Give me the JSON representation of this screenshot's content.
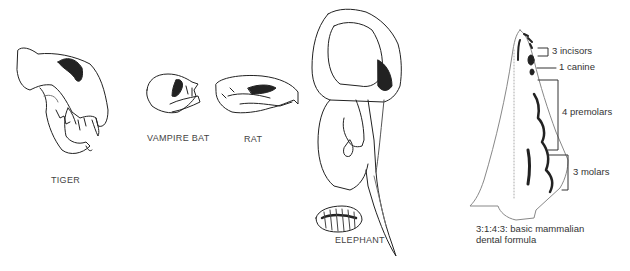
{
  "figure": {
    "specimens": [
      {
        "id": "tiger",
        "label": "TIGER"
      },
      {
        "id": "vampire-bat",
        "label": "VAMPIRE BAT"
      },
      {
        "id": "rat",
        "label": "RAT"
      },
      {
        "id": "elephant",
        "label": "ELEPHANT"
      }
    ],
    "jaw_diagram": {
      "callouts": [
        {
          "id": "incisors",
          "label": "3 incisors"
        },
        {
          "id": "canine",
          "label": "1 canine"
        },
        {
          "id": "premolars",
          "label": "4 premolars"
        },
        {
          "id": "molars",
          "label": "3 molars"
        }
      ],
      "formula_caption": "3:1:4:3: basic mammalian dental formula"
    }
  }
}
